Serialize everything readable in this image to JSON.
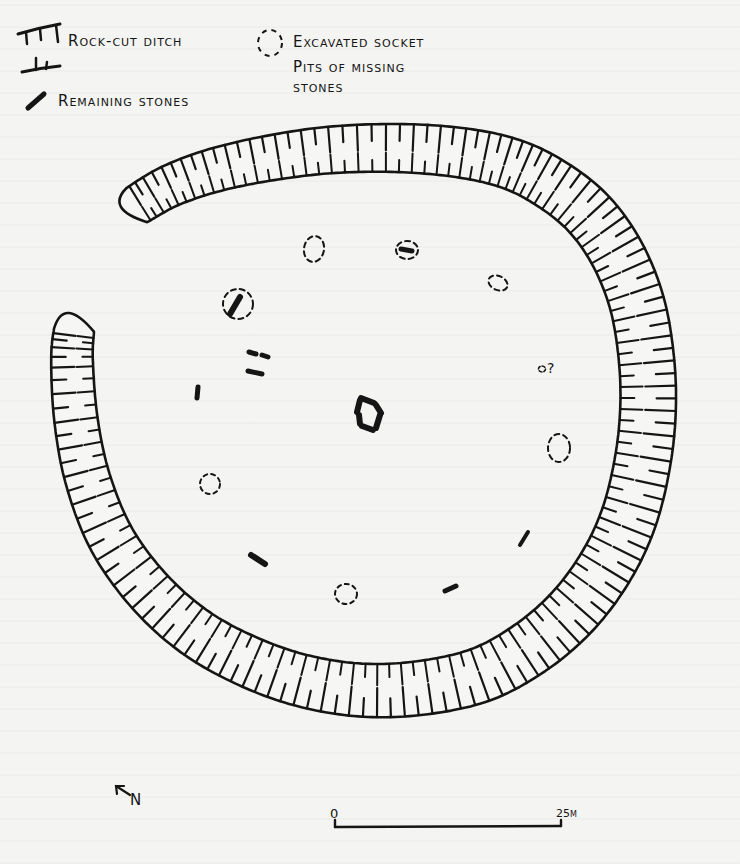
{
  "figure": {
    "type": "hand-drawn archaeological site plan",
    "ink_color": "#151515",
    "paper_color": "#f4f4f2"
  },
  "legend": {
    "items": [
      {
        "symbol": "ditch-hachure",
        "label": "Rock-cut ditch"
      },
      {
        "symbol": "dashed-circle",
        "label": "Excavated socket"
      },
      {
        "symbol": "dashed-circle",
        "label_line1": "Pits of missing",
        "label_line2": "stones"
      },
      {
        "symbol": "solid-bar",
        "label": "Remaining stones"
      }
    ]
  },
  "annotations": {
    "uncertain_socket": "?"
  },
  "north_arrow": {
    "label": "N",
    "direction": "north-west"
  },
  "scale_bar": {
    "start_label": "0",
    "end_label": "25m"
  }
}
